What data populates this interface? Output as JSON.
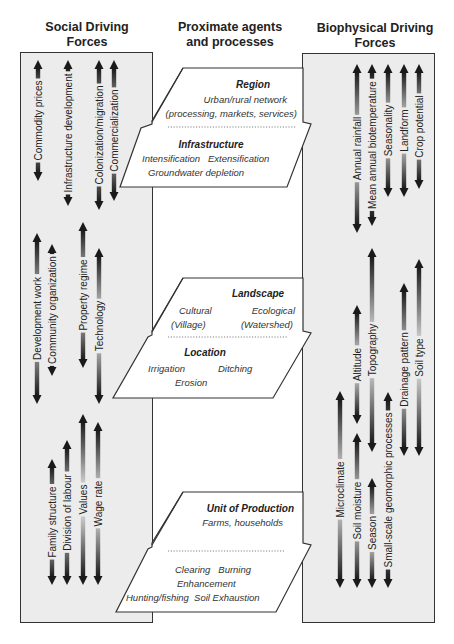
{
  "headings": {
    "social": "Social Driving Forces",
    "social_line1": "Social Driving",
    "social_line2": "Forces",
    "proximate_line1": "Proximate agents",
    "proximate_line2": "and processes",
    "biophysical_line1": "Biophysical Driving",
    "biophysical_line2": "Forces"
  },
  "colors": {
    "panel_fill": "#ececec",
    "border": "#333333",
    "arrow_dark": "#1a1a1a",
    "arrow_light": "#e6e6e6",
    "shape_fill": "#ffffff"
  },
  "social_forces": [
    {
      "label": "Commodity prices",
      "x": 38,
      "y1": 60,
      "y2": 181
    },
    {
      "label": "Infrastructure development",
      "x": 68,
      "y1": 60,
      "y2": 206
    },
    {
      "label": "Colonization/migration",
      "x": 99,
      "y1": 60,
      "y2": 210
    },
    {
      "label": "Commercialization",
      "x": 114,
      "y1": 60,
      "y2": 201
    },
    {
      "label": "Development work",
      "x": 37,
      "y1": 233,
      "y2": 404
    },
    {
      "label": "Community organization",
      "x": 52,
      "y1": 244,
      "y2": 376
    },
    {
      "label": "Property regime",
      "x": 83,
      "y1": 222,
      "y2": 368
    },
    {
      "label": "Technology",
      "x": 99,
      "y1": 248,
      "y2": 404
    },
    {
      "label": "Family structure",
      "x": 52,
      "y1": 459,
      "y2": 585
    },
    {
      "label": "Division of labour",
      "x": 67,
      "y1": 440,
      "y2": 585
    },
    {
      "label": "Values",
      "x": 83,
      "y1": 414,
      "y2": 585
    },
    {
      "label": "Wage rate",
      "x": 98,
      "y1": 422,
      "y2": 585
    }
  ],
  "biophysical_forces": [
    {
      "label": "Annual rainfall",
      "x": 357,
      "y1": 64,
      "y2": 233
    },
    {
      "label": "Mean annual biotemperature",
      "x": 372,
      "y1": 64,
      "y2": 226
    },
    {
      "label": "Seasonality",
      "x": 388,
      "y1": 64,
      "y2": 197
    },
    {
      "label": "Landform",
      "x": 404,
      "y1": 64,
      "y2": 197
    },
    {
      "label": "Crop potential",
      "x": 419,
      "y1": 64,
      "y2": 189
    },
    {
      "label": "Altitude",
      "x": 357,
      "y1": 305,
      "y2": 424
    },
    {
      "label": "Topography",
      "x": 372,
      "y1": 248,
      "y2": 452
    },
    {
      "label": "Drainage pattern",
      "x": 404,
      "y1": 283,
      "y2": 456
    },
    {
      "label": "Soil type",
      "x": 419,
      "y1": 259,
      "y2": 456
    },
    {
      "label": "Microclimate",
      "x": 340,
      "y1": 391,
      "y2": 588
    },
    {
      "label": "Soil moisture",
      "x": 357,
      "y1": 433,
      "y2": 588
    },
    {
      "label": "Season",
      "x": 372,
      "y1": 478,
      "y2": 588
    },
    {
      "label": "Small-scale geomorphic processes",
      "x": 388,
      "y1": 392,
      "y2": 588
    }
  ],
  "proximate": [
    {
      "id": "region-infrastructure",
      "upper_title": "Region",
      "upper_lines": [
        "Urban/rural network",
        "(processing, markets, services)"
      ],
      "lower_title": "Infrastructure",
      "lower_lines": [
        "Intensification   Extensification",
        "Groundwater depletion"
      ]
    },
    {
      "id": "landscape-location",
      "upper_title": "Landscape",
      "upper_lines": [
        "Cultural",
        "Ecological",
        "(Village)",
        "(Watershed)"
      ],
      "lower_title": "Location",
      "lower_lines": [
        "Irrigation",
        "Ditching",
        "Erosion"
      ]
    },
    {
      "id": "unit-of-production",
      "upper_title": "Unit of Production",
      "upper_lines": [
        "Farms, households"
      ],
      "lower_title": "",
      "lower_lines": [
        "Clearing   Burning",
        "Enhancement",
        "Hunting/fishing  Soil Exhaustion"
      ]
    }
  ]
}
